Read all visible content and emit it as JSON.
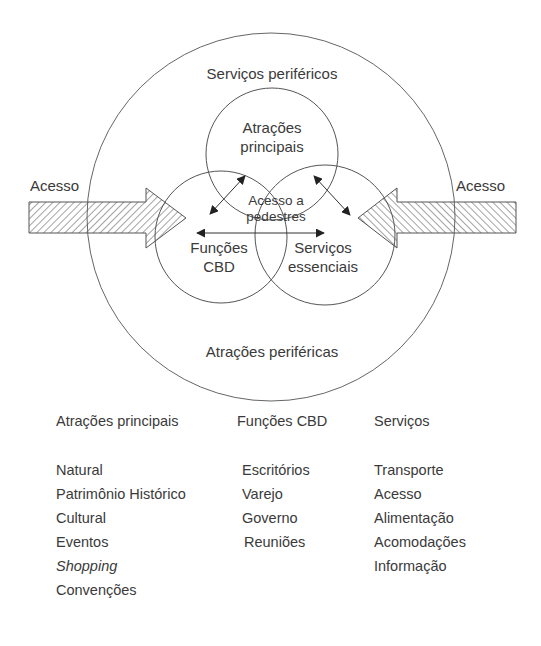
{
  "diagram": {
    "outer_label_top": "Serviços periféricos",
    "outer_label_bottom": "Atrações periféricas",
    "circle_top": {
      "line1": "Atrações",
      "line2": "principais"
    },
    "circle_left": {
      "line1": "Funções",
      "line2": "CBD"
    },
    "circle_right": {
      "line1": "Serviços",
      "line2": "essenciais"
    },
    "center_label": {
      "line1": "Acesso a",
      "line2": "pedestres"
    },
    "arrow_left_label": "Acesso",
    "arrow_right_label": "Acesso",
    "colors": {
      "line": "#555555",
      "text": "#3a3a3a",
      "hatch": "#555555",
      "background": "#ffffff"
    }
  },
  "legend": {
    "columns": [
      {
        "heading": "Atrações principais",
        "items": [
          {
            "text": "Natural",
            "italic": false
          },
          {
            "text": "Patrimônio Histórico",
            "italic": false
          },
          {
            "text": "Cultural",
            "italic": false
          },
          {
            "text": "Eventos",
            "italic": false
          },
          {
            "text": "Shopping",
            "italic": true
          },
          {
            "text": "Convenções",
            "italic": false
          }
        ]
      },
      {
        "heading": "Funções CBD",
        "items": [
          {
            "text": "Escritórios",
            "italic": false
          },
          {
            "text": "Varejo",
            "italic": false
          },
          {
            "text": "Governo",
            "italic": false
          },
          {
            "text": "Reuniões",
            "italic": false
          }
        ]
      },
      {
        "heading": "Serviços",
        "items": [
          {
            "text": "Transporte",
            "italic": false
          },
          {
            "text": "Acesso",
            "italic": false
          },
          {
            "text": "Alimentação",
            "italic": false
          },
          {
            "text": "Acomodações",
            "italic": false
          },
          {
            "text": "Informação",
            "italic": false
          }
        ]
      }
    ]
  }
}
